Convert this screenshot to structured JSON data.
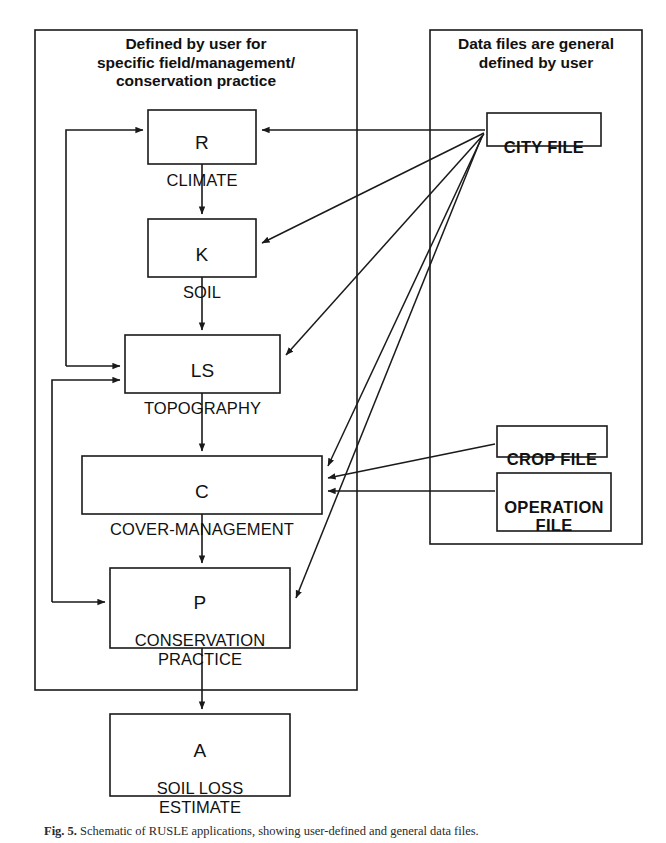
{
  "figure": {
    "caption_prefix": "Fig. 5.",
    "caption_text": "Schematic of RUSLE applications, showing user-defined and general data files.",
    "ink_color": "#1a1a1a",
    "background_color": "#ffffff"
  },
  "groups": [
    {
      "id": "user-defined-group",
      "title": "Defined by user for\nspecific field/management/\nconservation practice",
      "x": 35,
      "y": 30,
      "w": 322,
      "h": 660
    },
    {
      "id": "data-files-group",
      "title": "Data files are general\ndefined by user",
      "x": 430,
      "y": 30,
      "w": 212,
      "h": 514
    }
  ],
  "nodes": [
    {
      "id": "climate",
      "var": "R",
      "name": "CLIMATE",
      "x": 148,
      "y": 110,
      "w": 108,
      "h": 54
    },
    {
      "id": "soil",
      "var": "K",
      "name": "SOIL",
      "x": 148,
      "y": 219,
      "w": 108,
      "h": 58
    },
    {
      "id": "topography",
      "var": "LS",
      "name": "TOPOGRAPHY",
      "x": 125,
      "y": 335,
      "w": 155,
      "h": 58
    },
    {
      "id": "cover",
      "var": "C",
      "name": "COVER-MANAGEMENT",
      "x": 82,
      "y": 456,
      "w": 240,
      "h": 58
    },
    {
      "id": "practice",
      "var": "P",
      "name": "CONSERVATION\nPRACTICE",
      "x": 110,
      "y": 568,
      "w": 180,
      "h": 80
    },
    {
      "id": "soilloss",
      "var": "A",
      "name": "SOIL LOSS\nESTIMATE",
      "x": 110,
      "y": 714,
      "w": 180,
      "h": 82
    }
  ],
  "files": [
    {
      "id": "city-file",
      "label": "CITY FILE",
      "x": 487,
      "y": 113,
      "w": 114,
      "h": 33
    },
    {
      "id": "crop-file",
      "label": "CROP FILE",
      "x": 497,
      "y": 426,
      "w": 110,
      "h": 31
    },
    {
      "id": "operation-file",
      "label": "OPERATION\nFILE",
      "x": 497,
      "y": 473,
      "w": 114,
      "h": 58
    }
  ],
  "edges": [
    {
      "id": "climate-to-soil",
      "from": "climate",
      "to": "soil",
      "kind": "flow"
    },
    {
      "id": "soil-to-topography",
      "from": "soil",
      "to": "topography",
      "kind": "flow"
    },
    {
      "id": "topography-to-cover",
      "from": "topography",
      "to": "cover",
      "kind": "flow"
    },
    {
      "id": "cover-to-practice",
      "from": "cover",
      "to": "practice",
      "kind": "flow"
    },
    {
      "id": "practice-to-soilloss",
      "from": "practice",
      "to": "soilloss",
      "kind": "flow"
    },
    {
      "id": "cityfile-to-climate",
      "from": "city-file",
      "to": "climate",
      "kind": "data"
    },
    {
      "id": "cityfile-to-soil",
      "from": "city-file",
      "to": "soil",
      "kind": "data"
    },
    {
      "id": "cityfile-to-topography",
      "from": "city-file",
      "to": "topography",
      "kind": "data"
    },
    {
      "id": "cityfile-to-cover",
      "from": "city-file",
      "to": "cover",
      "kind": "data"
    },
    {
      "id": "cityfile-to-practice",
      "from": "city-file",
      "to": "practice",
      "kind": "data"
    },
    {
      "id": "cropfile-to-cover",
      "from": "crop-file",
      "to": "cover",
      "kind": "data"
    },
    {
      "id": "operationfile-to-cover",
      "from": "operation-file",
      "to": "cover",
      "kind": "data"
    },
    {
      "id": "climate-feedback-topography",
      "from": "climate",
      "to": "topography",
      "kind": "feedback"
    },
    {
      "id": "topography-feedback-practice",
      "from": "topography",
      "to": "practice",
      "kind": "feedback"
    }
  ]
}
